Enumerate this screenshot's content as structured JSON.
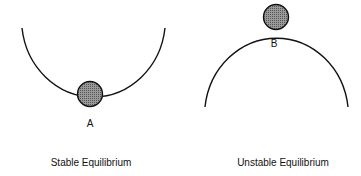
{
  "diagrams": [
    {
      "id": "stable",
      "caption": "Stable Equilibrium",
      "point_label": "A",
      "shape": "concave-up bowl",
      "ball_position": "bottom of bowl"
    },
    {
      "id": "unstable",
      "caption": "Unstable Equilibrium",
      "point_label": "B",
      "shape": "convex dome",
      "ball_position": "top of dome"
    }
  ],
  "colors": {
    "line": "#111111",
    "ball_fill": "#7a7a7a",
    "ball_stroke": "#111111",
    "background": "#ffffff"
  }
}
